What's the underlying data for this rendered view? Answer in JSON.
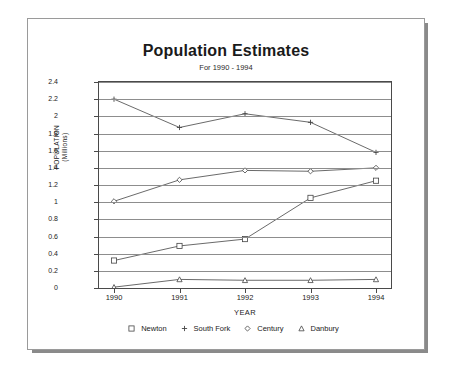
{
  "chart_data": {
    "type": "line",
    "title": "Population Estimates",
    "subtitle": "For 1990 - 1994",
    "xlabel": "YEAR",
    "ylabel_line1": "POPULATION",
    "ylabel_line2": "(Millions)",
    "categories": [
      "1990",
      "1991",
      "1992",
      "1993",
      "1994"
    ],
    "ylim": [
      0,
      2.4
    ],
    "ytick_labels": [
      "0",
      "0.2",
      "0.4",
      "0.6",
      "0.8",
      "1",
      "1.2",
      "1.4",
      "1.6",
      "1.8",
      "2",
      "2.2",
      "2.4"
    ],
    "ytick_values": [
      0,
      0.2,
      0.4,
      0.6,
      0.8,
      1,
      1.2,
      1.4,
      1.6,
      1.8,
      2,
      2.2,
      2.4
    ],
    "grid": true,
    "legend_position": "bottom",
    "series": [
      {
        "name": "Newton",
        "marker": "square",
        "values": [
          0.32,
          0.49,
          0.57,
          1.05,
          1.25
        ]
      },
      {
        "name": "South Fork",
        "marker": "plus",
        "values": [
          2.2,
          1.87,
          2.03,
          1.93,
          1.58
        ]
      },
      {
        "name": "Century",
        "marker": "diamond",
        "values": [
          1.01,
          1.26,
          1.37,
          1.36,
          1.4
        ]
      },
      {
        "name": "Danbury",
        "marker": "triangle",
        "values": [
          0.01,
          0.1,
          0.09,
          0.09,
          0.1
        ]
      }
    ],
    "colors": {
      "line": "#444444",
      "grid": "#8d8d8d",
      "axis": "#4a4a4a",
      "text": "#222222"
    }
  }
}
